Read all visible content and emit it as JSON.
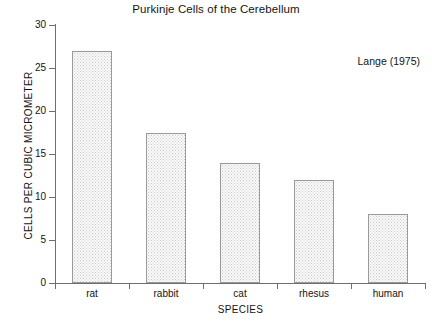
{
  "chart_data": {
    "type": "bar",
    "title": "Purkinje Cells of the Cerebellum",
    "xlabel": "SPECIES",
    "ylabel": "CELLS PER CUBIC MICROMETER",
    "categories": [
      "rat",
      "rabbit",
      "cat",
      "rhesus",
      "human"
    ],
    "values": [
      27,
      17.5,
      14,
      12,
      8
    ],
    "ylim": [
      0,
      30
    ],
    "ytick_labels": [
      "0",
      "5",
      "10",
      "15",
      "20",
      "25",
      "30"
    ],
    "ytick_values": [
      0,
      5,
      10,
      15,
      20,
      25,
      30
    ],
    "grid": false,
    "legend": false,
    "annotations": [
      {
        "text": "Lange (1975)",
        "position": "top-right"
      }
    ],
    "bar_fill_color": "#fafafa",
    "bar_pattern": "stippled-dots",
    "bar_border_color": "#9a9a9a",
    "axis_color": "#6e6e6e",
    "text_color": "#141414",
    "background_color": "#ffffff"
  }
}
